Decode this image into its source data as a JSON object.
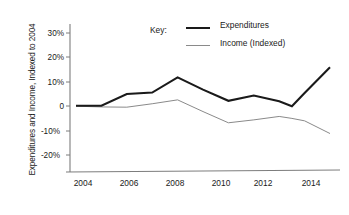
{
  "chart_data": {
    "type": "line",
    "title": "",
    "xlabel": "",
    "ylabel": "Expenditures and Income, Indexed to 2004",
    "x": [
      2004,
      2005,
      2006,
      2007,
      2008,
      2009,
      2010,
      2011,
      2012,
      2012.5,
      2013,
      2014
    ],
    "xlim": [
      2003.5,
      2014.6
    ],
    "ylim": [
      -20,
      30
    ],
    "xticks": [
      2004,
      2006,
      2008,
      2010,
      2012,
      2014
    ],
    "xticklabels": [
      "2004",
      "2006",
      "2008",
      "2010",
      "2012",
      "2014"
    ],
    "yticks": [
      30,
      20,
      10,
      0,
      -10,
      -20
    ],
    "yticklabels": [
      "30%",
      "20%",
      "10%",
      "0",
      "-10%",
      "-20%"
    ],
    "grid": false,
    "legend_position": "top-center",
    "legend_title": "Key:",
    "series": [
      {
        "name": "Expenditures",
        "color": "#1a1a1a",
        "width": 2.1,
        "values": [
          0.2,
          0.2,
          5.0,
          5.6,
          11.8,
          6.8,
          2.2,
          4.4,
          2.0,
          0.0,
          5.4,
          16.0
        ]
      },
      {
        "name": "Income (Indexed)",
        "color": "#8a8a8a",
        "width": 1.0,
        "values": [
          0.0,
          -0.3,
          -0.4,
          1.0,
          2.6,
          -2.2,
          -6.8,
          -5.6,
          -4.2,
          -5.0,
          -6.0,
          -11.2
        ]
      }
    ]
  },
  "axis": {
    "y_title": "Expenditures and Income, Indexed to 2004",
    "y_ticks": [
      "30%",
      "20%",
      "10%",
      "0",
      "-10%",
      "-20%"
    ],
    "x_ticks": [
      "2004",
      "2006",
      "2008",
      "2010",
      "2012",
      "2014"
    ]
  },
  "legend": {
    "title": "Key:",
    "entries": [
      {
        "label": "Expenditures",
        "style": "thick"
      },
      {
        "label": "Income (Indexed)",
        "style": "thin"
      }
    ]
  }
}
